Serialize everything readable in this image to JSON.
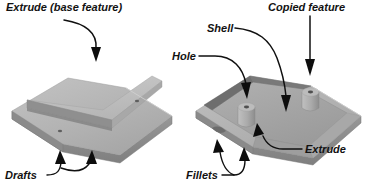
{
  "figure": {
    "background_color": "#ffffff",
    "text_color": "#121212",
    "leader_color": "#101010"
  },
  "callouts": [
    {
      "id": "extrude-base-feature",
      "label": "Extrude (base feature)",
      "x": 6,
      "y": 11,
      "font_size": 11,
      "anchor": "start",
      "target": "raised rib on left part"
    },
    {
      "id": "copied-feature",
      "label": "Copied feature",
      "x": 268,
      "y": 11,
      "font_size": 11,
      "anchor": "start",
      "target": "second boss on right part"
    },
    {
      "id": "shell",
      "label": "Shell",
      "x": 207,
      "y": 32,
      "font_size": 11,
      "anchor": "start",
      "target": "hollowed interior wall of right part"
    },
    {
      "id": "hole",
      "label": "Hole",
      "x": 172,
      "y": 60,
      "font_size": 11,
      "anchor": "start",
      "target": "bore in first boss"
    },
    {
      "id": "drafts",
      "label": "Drafts",
      "x": 5,
      "y": 179,
      "font_size": 11,
      "anchor": "start",
      "target": "angled side faces of left part"
    },
    {
      "id": "fillets",
      "label": "Fillets",
      "x": 186,
      "y": 179,
      "font_size": 11,
      "anchor": "start",
      "target": "rounded corners of right part"
    },
    {
      "id": "extrude",
      "label": "Extrude",
      "x": 305,
      "y": 153,
      "font_size": 11,
      "anchor": "start",
      "target": "boss post on right part"
    }
  ],
  "parts": [
    {
      "id": "left-part",
      "name": "Base extrusion plate with rib",
      "features": [
        "extrude",
        "drafts"
      ],
      "fill_top": "#b9b9b9",
      "fill_front": "#8e8e8e",
      "fill_side": "#a0a0a0",
      "fill_rib_top": "#c4c4c4",
      "fill_rib_face": "#8a8a8a",
      "holes": 2
    },
    {
      "id": "right-part",
      "name": "Shelled tray with bosses",
      "features": [
        "shell",
        "hole",
        "copied feature",
        "fillets",
        "extrude"
      ],
      "fill_top": "#b5b5b5",
      "fill_inner": "#a6a6a6",
      "fill_front": "#8c8c8c",
      "fill_wall": "#6f6f6f",
      "fill_boss": "#b0b0b0",
      "bosses": 2
    }
  ]
}
